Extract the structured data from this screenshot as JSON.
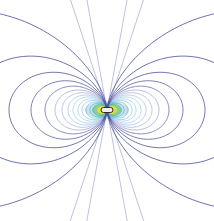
{
  "figure": {
    "type": "dipole-field-lines",
    "background": "#ffffff",
    "center": [
      107,
      110
    ],
    "width": 214,
    "height": 221
  },
  "field_lines": {
    "outer_color": "#4a4f9a",
    "shells": [
      {
        "L": 8,
        "color": "#e8e030"
      },
      {
        "L": 11,
        "color": "#b8d840"
      },
      {
        "L": 14,
        "color": "#60c070"
      },
      {
        "L": 17,
        "color": "#38b0a0"
      },
      {
        "L": 21,
        "color": "#40a8c8"
      },
      {
        "L": 25,
        "color": "#58b4d8"
      },
      {
        "L": 29,
        "color": "#70bce0"
      },
      {
        "L": 34,
        "color": "#80b8e0"
      },
      {
        "L": 39,
        "color": "#8aa8d8"
      },
      {
        "L": 45,
        "color": "#8c98d0"
      },
      {
        "L": 52,
        "color": "#8088c4"
      },
      {
        "L": 62,
        "color": "#6a6eb0"
      },
      {
        "L": 76,
        "color": "#5a5ea4"
      },
      {
        "L": 98,
        "color": "#4e529c"
      },
      {
        "L": 140,
        "color": "#4a4f9a"
      },
      {
        "L": 260,
        "color": "#4a4f9a"
      }
    ]
  },
  "core": {
    "label": "",
    "color": "#f0f0f0",
    "ring_color": "#2a2a2a",
    "glow_colors": [
      "#f0e020",
      "#40c080",
      "#3080d0"
    ]
  }
}
